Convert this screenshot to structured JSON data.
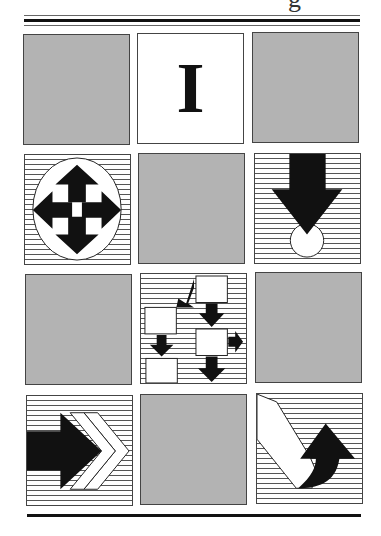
{
  "header": {
    "title_fragment": "g"
  },
  "grid": {
    "rows": 4,
    "cols": 3,
    "colors": {
      "gray": "#b3b3b3",
      "border": "#444444",
      "ink": "#111111"
    },
    "tiles": [
      {
        "row": 1,
        "col": 1,
        "type": "blank-gray"
      },
      {
        "row": 1,
        "col": 2,
        "type": "text-cursor-icon",
        "glyph": "I"
      },
      {
        "row": 1,
        "col": 3,
        "type": "blank-gray"
      },
      {
        "row": 2,
        "col": 1,
        "type": "move-cursor-icon"
      },
      {
        "row": 2,
        "col": 2,
        "type": "blank-gray"
      },
      {
        "row": 2,
        "col": 3,
        "type": "down-arrow-target-icon"
      },
      {
        "row": 3,
        "col": 1,
        "type": "blank-gray"
      },
      {
        "row": 3,
        "col": 2,
        "type": "flowchart-icon"
      },
      {
        "row": 3,
        "col": 3,
        "type": "blank-gray"
      },
      {
        "row": 4,
        "col": 1,
        "type": "forward-arrow-icon"
      },
      {
        "row": 4,
        "col": 2,
        "type": "blank-gray"
      },
      {
        "row": 4,
        "col": 3,
        "type": "curved-arrow-icon"
      }
    ]
  }
}
